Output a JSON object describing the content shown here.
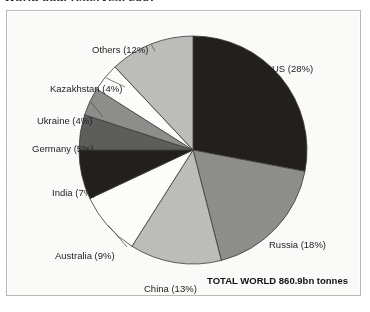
{
  "page": {
    "cropped_heading": "World coal reserves, 2007"
  },
  "chart_data": {
    "type": "pie",
    "title": "World coal reserves, 2007",
    "unit_note": "TOTAL WORLD 860.9bn tonnes",
    "total_label": "TOTAL WORLD",
    "total_value": "860.9bn tonnes",
    "legend_position": "callout-labels",
    "start_angle_deg": 0,
    "direction": "clockwise",
    "categories": [
      "US",
      "Russia",
      "China",
      "Australia",
      "India",
      "Germany",
      "Ukraine",
      "Kazakhstan",
      "Others"
    ],
    "values": [
      28,
      18,
      13,
      9,
      7,
      5,
      4,
      4,
      12
    ],
    "value_suffix": "%",
    "slices": [
      {
        "name": "US",
        "value": 28,
        "label": "US (28%)",
        "color": "#231f1d",
        "start_deg": 0,
        "end_deg": 100.8,
        "label_x": 265,
        "label_y": 52,
        "align": "left"
      },
      {
        "name": "Russia",
        "value": 18,
        "label": "Russia (18%)",
        "color": "#8e8e8c",
        "start_deg": 100.8,
        "end_deg": 165.6,
        "label_x": 262,
        "label_y": 228,
        "align": "left"
      },
      {
        "name": "China",
        "value": 13,
        "label": "China (13%)",
        "color": "#bdbdbb",
        "start_deg": 165.6,
        "end_deg": 212.4,
        "label_x": 137,
        "label_y": 272,
        "align": "left"
      },
      {
        "name": "Australia",
        "value": 9,
        "label": "Australia (9%)",
        "color": "#fdfdfb",
        "start_deg": 212.4,
        "end_deg": 244.8,
        "label_x": 48,
        "label_y": 239,
        "align": "left"
      },
      {
        "name": "India",
        "value": 7,
        "label": "India (7%)",
        "color": "#231f1d",
        "start_deg": 244.8,
        "end_deg": 270.0,
        "label_x": 45,
        "label_y": 176,
        "align": "left"
      },
      {
        "name": "Germany",
        "value": 5,
        "label": "Germany (5%)",
        "color": "#5d5d5b",
        "start_deg": 270.0,
        "end_deg": 288.0,
        "label_x": 25,
        "label_y": 132,
        "align": "left"
      },
      {
        "name": "Ukraine",
        "value": 4,
        "label": "Ukraine (4%)",
        "color": "#8e8e8c",
        "start_deg": 288.0,
        "end_deg": 302.4,
        "label_x": 30,
        "label_y": 104,
        "align": "left"
      },
      {
        "name": "Kazakhstan",
        "value": 4,
        "label": "Kazakhstan (4%)",
        "color": "#fdfdfb",
        "start_deg": 302.4,
        "end_deg": 316.8,
        "label_x": 43,
        "label_y": 72,
        "align": "left"
      },
      {
        "name": "Others",
        "value": 12,
        "label": "Others (12%)",
        "color": "#bdbdbb",
        "start_deg": 316.8,
        "end_deg": 360.0,
        "label_x": 85,
        "label_y": 33,
        "align": "left"
      }
    ],
    "geometry": {
      "cx": 186,
      "cy": 139,
      "r": 114
    },
    "stroke_color": "#3a3a38"
  }
}
